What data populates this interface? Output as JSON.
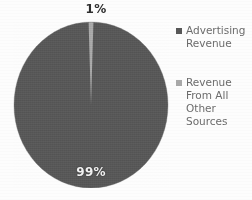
{
  "chart_data": {
    "type": "pie",
    "title": "",
    "subtitle": "",
    "xlabel": "",
    "ylabel": "",
    "grid": false,
    "legend_position": "right",
    "start_angle_deg": 0,
    "direction": "clockwise",
    "categories": [
      "Advertising Revenue",
      "Revenue From All Other Sources"
    ],
    "values": [
      99,
      1
    ],
    "value_unit": "percent",
    "data_labels": [
      "99%",
      "1%"
    ],
    "colors": [
      "#585858",
      "#a9a9a9"
    ],
    "slices": [
      {
        "label": "Advertising Revenue",
        "value": 99,
        "data_label": "99%",
        "color": "#585858"
      },
      {
        "label": "Revenue From All Other Sources",
        "value": 1,
        "data_label": "1%",
        "color": "#a9a9a9"
      }
    ]
  },
  "labels": {
    "small_slice": "1%",
    "large_slice": "99%"
  },
  "legend": {
    "entries": [
      {
        "swatch_color": "#585858",
        "label": "Advertising Revenue",
        "lines": [
          "Advertising",
          "Revenue"
        ]
      },
      {
        "swatch_color": "#a9a9a9",
        "label": "Revenue From All Other Sources",
        "lines": [
          "Revenue",
          "From All",
          "Other",
          "Sources"
        ]
      }
    ]
  },
  "colors": {
    "background": "#fdfdfd",
    "slice_dark": "#585858",
    "slice_light": "#a9a9a9",
    "legend_text": "#6c6c6c",
    "label_dark": "#2e2e2e",
    "label_light": "#f2f2f2"
  }
}
